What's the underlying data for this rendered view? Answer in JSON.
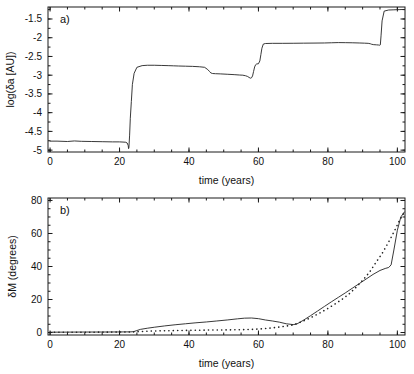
{
  "figure": {
    "background": "#ffffff",
    "ink": "#1a1a1a",
    "width": 414,
    "height": 374
  },
  "chart_data": [
    {
      "type": "line",
      "panel": "a)",
      "title": "",
      "xlabel": "time (years)",
      "ylabel": "log(δa [AU])",
      "xlim": [
        -0.6,
        102.2
      ],
      "ylim": [
        -5.05,
        -1.18
      ],
      "xticks": [
        0,
        20,
        40,
        60,
        80,
        100
      ],
      "xticklabels": [
        "0",
        "20",
        "40",
        "60",
        "80",
        "100"
      ],
      "xminor_step": 5,
      "yticks": [
        -1.5,
        -2,
        -2.5,
        -3,
        -3.5,
        -4,
        -4.5,
        -5
      ],
      "yticklabels": [
        "-1.5",
        "-2",
        "-2.5",
        "-3",
        "-3.5",
        "-4",
        "-4.5",
        "-5"
      ],
      "yminor_step": 0.25,
      "grid": false,
      "legend": "none",
      "series": [
        {
          "name": "log(δa)",
          "style": "solid",
          "x": [
            0.0,
            2.0,
            5.0,
            7.0,
            9.0,
            12.0,
            15.0,
            18.0,
            20.0,
            21.0,
            21.8,
            22.2,
            22.5,
            22.6,
            22.7,
            22.9,
            23.1,
            23.4,
            23.7,
            24.2,
            25.0,
            26.5,
            28.0,
            30.0,
            32.0,
            34.0,
            35.5,
            37.0,
            39.0,
            41.0,
            43.0,
            44.5,
            45.4,
            45.9,
            46.3,
            46.8,
            47.6,
            49.0,
            51.0,
            53.0,
            54.5,
            55.5,
            56.3,
            56.9,
            57.3,
            57.6,
            57.8,
            58.0,
            58.3,
            58.6,
            58.9,
            59.2,
            59.5,
            60.0,
            60.4,
            60.7,
            61.0,
            61.4,
            62.0,
            64.0,
            67.0,
            70.0,
            73.0,
            76.0,
            79.0,
            81.0,
            83.0,
            85.0,
            87.0,
            89.0,
            90.5,
            91.6,
            92.2,
            92.6,
            93.2,
            94.0,
            94.6,
            94.9,
            95.1,
            95.3,
            95.6,
            96.2,
            97.5,
            99.0,
            100.5,
            102.0
          ],
          "y": [
            -4.76,
            -4.76,
            -4.77,
            -4.755,
            -4.765,
            -4.77,
            -4.775,
            -4.78,
            -4.78,
            -4.785,
            -4.79,
            -4.81,
            -4.88,
            -4.96,
            -4.93,
            -4.6,
            -4.15,
            -3.7,
            -3.25,
            -2.95,
            -2.79,
            -2.745,
            -2.735,
            -2.735,
            -2.74,
            -2.745,
            -2.75,
            -2.755,
            -2.76,
            -2.765,
            -2.775,
            -2.79,
            -2.85,
            -2.9,
            -2.94,
            -2.955,
            -2.96,
            -2.965,
            -2.975,
            -2.985,
            -2.995,
            -3.0,
            -3.015,
            -3.035,
            -3.06,
            -3.075,
            -3.08,
            -3.07,
            -3.02,
            -2.9,
            -2.78,
            -2.72,
            -2.7,
            -2.695,
            -2.62,
            -2.45,
            -2.28,
            -2.17,
            -2.155,
            -2.15,
            -2.15,
            -2.148,
            -2.145,
            -2.143,
            -2.14,
            -2.135,
            -2.13,
            -2.132,
            -2.135,
            -2.14,
            -2.145,
            -2.15,
            -2.16,
            -2.175,
            -2.185,
            -2.19,
            -2.195,
            -2.2,
            -2.19,
            -1.95,
            -1.55,
            -1.29,
            -1.26,
            -1.255,
            -1.25,
            -1.245,
            -1.242,
            -1.24
          ]
        }
      ]
    },
    {
      "type": "line",
      "panel": "b)",
      "title": "",
      "xlabel": "time (years)",
      "ylabel": "δM (degrees)",
      "xlim": [
        -0.6,
        102.2
      ],
      "ylim": [
        -1.5,
        81.5
      ],
      "xticks": [
        0,
        20,
        40,
        60,
        80,
        100
      ],
      "xticklabels": [
        "0",
        "20",
        "40",
        "60",
        "80",
        "100"
      ],
      "xminor_step": 5,
      "yticks": [
        0,
        20,
        40,
        60,
        80
      ],
      "yticklabels": [
        "0",
        "20",
        "40",
        "60",
        "80"
      ],
      "yminor_step": 5,
      "grid": false,
      "legend": "none",
      "series": [
        {
          "name": "δM solid",
          "style": "solid",
          "x": [
            0,
            5,
            10,
            15,
            20,
            23,
            24,
            25,
            26,
            28,
            30,
            33,
            36,
            39,
            42,
            45,
            48,
            51,
            54,
            56,
            58,
            60,
            62,
            64,
            66,
            68,
            70,
            71,
            73,
            75,
            77,
            79,
            81,
            83,
            85,
            87,
            89,
            91,
            93,
            95,
            96.5,
            97.5,
            98.2,
            99.0,
            100.0,
            101.0,
            102.0
          ],
          "y": [
            0.2,
            0.25,
            0.3,
            0.3,
            0.35,
            0.4,
            0.5,
            1.2,
            1.9,
            2.6,
            3.2,
            4.0,
            4.7,
            5.3,
            5.9,
            6.4,
            7.0,
            7.6,
            8.3,
            8.7,
            8.8,
            8.4,
            7.6,
            7.0,
            6.3,
            5.3,
            4.8,
            5.1,
            7.5,
            10.2,
            13.0,
            15.8,
            18.6,
            21.3,
            24.0,
            26.8,
            29.6,
            32.4,
            35.2,
            37.6,
            38.8,
            39.4,
            41.0,
            50.0,
            62.0,
            70.0,
            73.0
          ]
        },
        {
          "name": "δM dotted",
          "style": "dotted",
          "x": [
            0,
            6,
            12,
            18,
            22,
            24,
            26,
            28,
            31,
            34,
            37,
            40,
            43,
            46,
            49,
            52,
            55,
            58,
            60,
            62,
            64,
            66,
            68,
            70,
            72,
            74,
            76,
            78,
            80,
            82,
            84,
            86,
            88,
            90,
            92,
            94,
            95.5,
            97,
            98.3,
            99.5,
            100.5,
            101.5,
            102.0
          ],
          "y": [
            0.15,
            0.2,
            0.2,
            0.25,
            0.3,
            0.4,
            0.6,
            0.8,
            1.0,
            1.1,
            1.2,
            1.3,
            1.4,
            1.5,
            1.55,
            1.6,
            1.7,
            1.9,
            2.1,
            2.4,
            2.8,
            3.3,
            3.9,
            4.6,
            6.2,
            8.0,
            10.0,
            12.2,
            14.6,
            17.2,
            20.0,
            23.2,
            27.2,
            31.6,
            36.6,
            43.0,
            47.5,
            53.0,
            58.0,
            63.0,
            67.5,
            71.0,
            73.0
          ]
        }
      ]
    }
  ]
}
